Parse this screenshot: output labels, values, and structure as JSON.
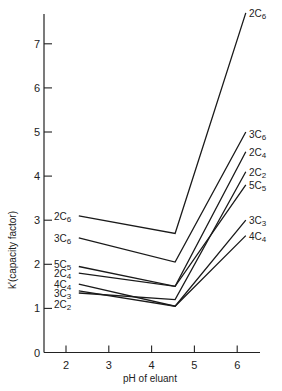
{
  "chart_data": {
    "type": "line",
    "title": "",
    "xlabel": "pH of eluant",
    "ylabel": "k'(capacity factor)",
    "xlim": [
      1.65,
      6.7
    ],
    "ylim": [
      0,
      7.7
    ],
    "xticks": [
      2,
      3,
      4,
      5,
      6
    ],
    "yticks": [
      0,
      1,
      2,
      3,
      4,
      5,
      6,
      7
    ],
    "grid": false,
    "legend": "inline labels at line ends",
    "x": [
      2.3,
      4.55,
      6.2
    ],
    "series": [
      {
        "name": "2C6",
        "values": [
          3.1,
          2.7,
          7.7
        ]
      },
      {
        "name": "3C6",
        "values": [
          2.6,
          2.05,
          5.0
        ]
      },
      {
        "name": "5C5",
        "values": [
          1.95,
          1.5,
          3.8
        ]
      },
      {
        "name": "2C4",
        "values": [
          1.8,
          1.5,
          4.55
        ]
      },
      {
        "name": "4C4",
        "values": [
          1.55,
          1.05,
          2.65
        ]
      },
      {
        "name": "3C3",
        "values": [
          1.4,
          1.05,
          3.0
        ]
      },
      {
        "name": "2C2",
        "values": [
          1.35,
          1.2,
          4.1
        ]
      }
    ],
    "left_labels": [
      {
        "name": "2C6",
        "y": 3.1
      },
      {
        "name": "3C6",
        "y": 2.6
      },
      {
        "name": "5C5",
        "y": 2.0
      },
      {
        "name": "2C4",
        "y": 1.8
      },
      {
        "name": "4C4",
        "y": 1.55
      },
      {
        "name": "3C3",
        "y": 1.35
      },
      {
        "name": "2C2",
        "y": 1.1
      }
    ],
    "right_labels": [
      {
        "name": "2C6",
        "y": 7.7
      },
      {
        "name": "3C6",
        "y": 4.95
      },
      {
        "name": "2C4",
        "y": 4.55
      },
      {
        "name": "2C2",
        "y": 4.1
      },
      {
        "name": "5C5",
        "y": 3.8
      },
      {
        "name": "3C3",
        "y": 3.0
      },
      {
        "name": "4C4",
        "y": 2.65
      }
    ]
  }
}
